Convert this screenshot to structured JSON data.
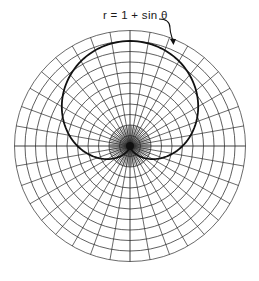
{
  "figure": {
    "curve_label": "r = 1 + sin θ",
    "colors": {
      "background": "#ffffff",
      "grid": "#2a2a2a",
      "curve": "#111111",
      "label": "#1a1a1a"
    }
  },
  "chart_data": {
    "type": "polar_line",
    "title": "",
    "equation": "r = 1 + sin θ",
    "annotation": {
      "text": "r = 1 + sin θ",
      "arrow_to": "curve upper-right",
      "position": "top"
    },
    "grid": {
      "concentric_circles": 11,
      "circle_step": 0.2,
      "r_max": 2.2,
      "radial_lines": 36,
      "radial_step_deg": 10,
      "inner_dense_radial_lines": 72,
      "inner_dense_radius": 0.2,
      "tick_labels": false
    },
    "series": [
      {
        "name": "r = 1 + sin θ",
        "theta_deg": [
          0,
          30,
          60,
          90,
          120,
          150,
          180,
          210,
          240,
          270,
          300,
          330,
          360
        ],
        "r": [
          1.0,
          1.5,
          1.866,
          2.0,
          1.866,
          1.5,
          1.0,
          0.5,
          0.134,
          0.0,
          0.134,
          0.5,
          1.0
        ]
      }
    ],
    "legend": "none"
  }
}
